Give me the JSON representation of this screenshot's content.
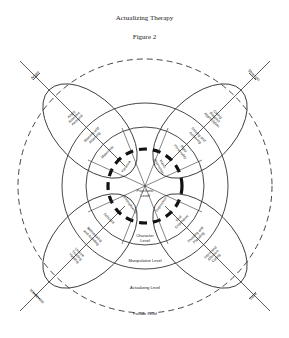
{
  "header": {
    "title": "Actualizing Therapy",
    "figure": "Figure 2"
  },
  "axes": {
    "upper_left": "Anger",
    "upper_right": "Strength",
    "lower_left": "Weakness",
    "lower_right": "Love"
  },
  "levels": {
    "psychotic": [
      "Psychotic",
      "Level"
    ],
    "character": [
      "Character",
      "Level"
    ],
    "manipulative": "Manipulative Level",
    "actualizing": "Actualizing Level",
    "facade": "Facade Level"
  },
  "ellipse_outer": {
    "upper_left": [
      "Angry",
      "Assertive",
      "Annoyed"
    ],
    "upper_right": [
      "Caring",
      "Respect",
      "Appreciation"
    ],
    "lower_left": [
      "Unsure",
      "Trusting",
      "Yielding"
    ],
    "lower_right": [
      "Interested",
      "Affection",
      "Caring"
    ]
  },
  "manipulative_ring": {
    "upper_left": [
      "Blaming and",
      "Attacking"
    ],
    "upper_right": [
      "Striving and",
      "Achieving"
    ],
    "lower_left": [
      "Withdrawing",
      "and Avoiding"
    ],
    "lower_right": [
      "Pleasing and",
      "Placating"
    ]
  },
  "character_ring": {
    "upper_left": "Masochist",
    "upper_right": [
      "Rigid",
      "Personality"
    ],
    "lower_left": "Schizoid",
    "lower_right": [
      "Oral",
      "Dependent"
    ]
  },
  "psychotic_ring": {
    "upper_left": "Paranoia",
    "upper_right": [
      "Manic",
      "Depressive"
    ],
    "lower_left": "Schizophrenia",
    "lower_right": "Depression"
  }
}
